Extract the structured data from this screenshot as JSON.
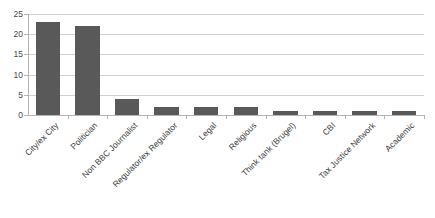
{
  "chart_data": {
    "type": "bar",
    "title": "",
    "subtitle": "",
    "xlabel": "",
    "ylabel": "",
    "categories": [
      "City/ex City",
      "Politician",
      "Non BBC Journalist",
      "Regulator/ex Regulator",
      "Legal",
      "Religious",
      "Think tank (Brugel)",
      "CBI",
      "Tax Justice Network",
      "Academic"
    ],
    "values": [
      23,
      22,
      4,
      2,
      2,
      2,
      1,
      1,
      1,
      1
    ],
    "ylim": [
      0,
      25
    ],
    "yticks": [
      0,
      5,
      10,
      15,
      20,
      25
    ],
    "ytick_labels": [
      "0",
      "5",
      "10",
      "15",
      "20",
      "25"
    ],
    "grid": true,
    "grid_axis": "y",
    "legend": false,
    "legend_position": "none",
    "bar_color": "#595959",
    "gridline_color": "#d0d0d0",
    "axis_color": "#b5b5b5",
    "background_color": "#ffffff",
    "text_color": "#3d3d3d",
    "label_rotation": -45
  }
}
